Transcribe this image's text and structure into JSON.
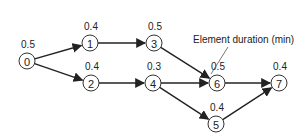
{
  "diagram": {
    "type": "precedence-network",
    "annotation": "Element duration (min)",
    "nodes": [
      {
        "id": "0",
        "label": "0",
        "duration": "0.5",
        "x": 27,
        "y": 61
      },
      {
        "id": "1",
        "label": "1",
        "duration": "0.4",
        "x": 90,
        "y": 43
      },
      {
        "id": "2",
        "label": "2",
        "duration": "0.4",
        "x": 91,
        "y": 83
      },
      {
        "id": "3",
        "label": "3",
        "duration": "0.5",
        "x": 154,
        "y": 43
      },
      {
        "id": "4",
        "label": "4",
        "duration": "0.3",
        "x": 153,
        "y": 83
      },
      {
        "id": "6",
        "label": "6",
        "duration": "0.5",
        "x": 217,
        "y": 83
      },
      {
        "id": "5",
        "label": "5",
        "duration": "0.4",
        "x": 216,
        "y": 124
      },
      {
        "id": "7",
        "label": "7",
        "duration": "0.4",
        "x": 279,
        "y": 83
      }
    ],
    "edges": [
      {
        "from": "0",
        "to": "1"
      },
      {
        "from": "0",
        "to": "2"
      },
      {
        "from": "1",
        "to": "3"
      },
      {
        "from": "2",
        "to": "4"
      },
      {
        "from": "3",
        "to": "6"
      },
      {
        "from": "4",
        "to": "6"
      },
      {
        "from": "4",
        "to": "5"
      },
      {
        "from": "6",
        "to": "7"
      },
      {
        "from": "5",
        "to": "7"
      }
    ]
  }
}
